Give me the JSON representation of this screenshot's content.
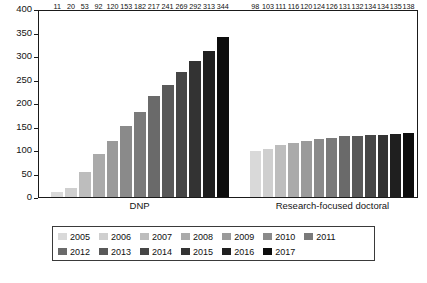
{
  "chart_data": {
    "type": "bar",
    "title": "",
    "subtitle": "",
    "xlabel": "",
    "ylabel": "",
    "ylim": [
      0,
      400
    ],
    "yticks": [
      0,
      50,
      100,
      150,
      200,
      250,
      300,
      350,
      400
    ],
    "grid": false,
    "legend_position": "bottom",
    "categories": [
      "DNP",
      "Research-focused doctoral"
    ],
    "series": [
      {
        "name": "2005",
        "color": "#d9d9d9",
        "values": [
          11,
          98
        ]
      },
      {
        "name": "2006",
        "color": "#cfcfcf",
        "values": [
          20,
          103
        ]
      },
      {
        "name": "2007",
        "color": "#bdbdbd",
        "values": [
          53,
          111
        ]
      },
      {
        "name": "2008",
        "color": "#aaaaaa",
        "values": [
          92,
          116
        ]
      },
      {
        "name": "2009",
        "color": "#9a9a9a",
        "values": [
          120,
          120
        ]
      },
      {
        "name": "2010",
        "color": "#8a8a8a",
        "values": [
          153,
          124
        ]
      },
      {
        "name": "2011",
        "color": "#7a7a7a",
        "values": [
          182,
          126
        ]
      },
      {
        "name": "2012",
        "color": "#6a6a6a",
        "values": [
          217,
          131
        ]
      },
      {
        "name": "2013",
        "color": "#595959",
        "values": [
          241,
          132
        ]
      },
      {
        "name": "2014",
        "color": "#464646",
        "values": [
          269,
          134
        ]
      },
      {
        "name": "2015",
        "color": "#333333",
        "values": [
          292,
          134
        ]
      },
      {
        "name": "2016",
        "color": "#1f1f1f",
        "values": [
          313,
          135
        ]
      },
      {
        "name": "2017",
        "color": "#0d0d0d",
        "values": [
          344,
          138
        ]
      }
    ],
    "group_labels": {
      "dnp": "DNP",
      "research": "Research-focused doctoral"
    }
  },
  "caption": {
    "text": ""
  }
}
